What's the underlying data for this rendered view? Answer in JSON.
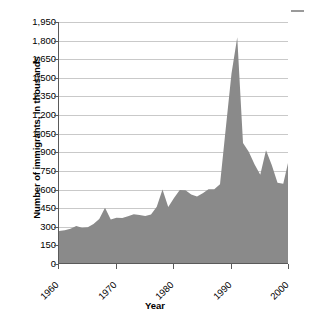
{
  "chart_data": {
    "type": "area",
    "title": "",
    "xlabel": "Year",
    "ylabel": "Number of immigrants, in thousands",
    "xlim": [
      1960,
      2000
    ],
    "ylim": [
      0,
      1950
    ],
    "grid": true,
    "legend_position": "none",
    "series_color": "#8a8a8a",
    "ytick_labels": [
      "1,950",
      "1,800",
      "1,650",
      "1,500",
      "1,350",
      "1,200",
      "1,050",
      "900",
      "750",
      "600",
      "450",
      "300",
      "150",
      "0"
    ],
    "ytick_values": [
      1950,
      1800,
      1650,
      1500,
      1350,
      1200,
      1050,
      900,
      750,
      600,
      450,
      300,
      150,
      0
    ],
    "xtick_labels": [
      "1960",
      "1970",
      "1980",
      "1990",
      "2000"
    ],
    "xtick_values": [
      1960,
      1970,
      1980,
      1990,
      2000
    ],
    "x": [
      1960,
      1961,
      1962,
      1963,
      1964,
      1965,
      1966,
      1967,
      1968,
      1969,
      1970,
      1971,
      1972,
      1973,
      1974,
      1975,
      1976,
      1977,
      1978,
      1979,
      1980,
      1981,
      1982,
      1983,
      1984,
      1985,
      1986,
      1987,
      1988,
      1989,
      1990,
      1991,
      1992,
      1993,
      1994,
      1995,
      1996,
      1997,
      1998,
      1999,
      2000
    ],
    "values": [
      265,
      271,
      284,
      306,
      292,
      297,
      323,
      362,
      454,
      359,
      373,
      370,
      385,
      400,
      395,
      386,
      399,
      462,
      601,
      460,
      531,
      597,
      594,
      560,
      544,
      570,
      602,
      602,
      643,
      1091,
      1536,
      1827,
      974,
      904,
      804,
      720,
      916,
      798,
      654,
      647,
      850
    ]
  }
}
